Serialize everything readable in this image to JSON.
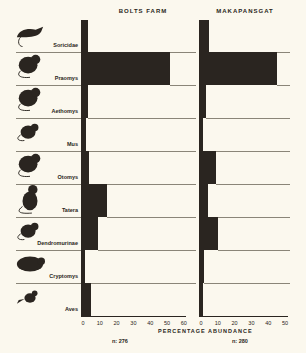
{
  "chart_data": {
    "type": "bar",
    "orientation": "horizontal",
    "title": "",
    "xlabel": "PERCENTAGE ABUNDANCE",
    "categories": [
      "Soricidae",
      "Praomys",
      "Aethomys",
      "Mus",
      "Otomys",
      "Tatera",
      "Dendromurinae",
      "Cryptomys",
      "Aves"
    ],
    "series": [
      {
        "name": "BOLTS FARM",
        "n": "n: 276",
        "values": [
          3,
          52,
          3,
          1.5,
          3.5,
          14,
          9,
          0,
          5
        ],
        "xlim": [
          0,
          60
        ],
        "ticks": [
          "0",
          "10",
          "20",
          "30",
          "40",
          "50",
          "60"
        ]
      },
      {
        "name": "MAKAPANSGAT",
        "n": "n: 280",
        "values": [
          5,
          45,
          3,
          0.5,
          9,
          4,
          10,
          2,
          0.5
        ],
        "xlim": [
          0,
          50
        ],
        "ticks": [
          "0",
          "10",
          "20",
          "30",
          "40",
          "50"
        ]
      }
    ],
    "grid": false
  },
  "panels": {
    "left": {
      "title": "BOLTS FARM",
      "n": "n: 276"
    },
    "right": {
      "title": "MAKAPANSGAT",
      "n": "n: 280"
    }
  },
  "xlabel": "PERCENTAGE ABUNDANCE",
  "icons": [
    "shrew-icon",
    "rat-icon",
    "rat-icon",
    "mouse-icon",
    "rat-icon",
    "gerbil-icon",
    "mouse-icon",
    "mole-rat-icon",
    "bird-icon"
  ]
}
